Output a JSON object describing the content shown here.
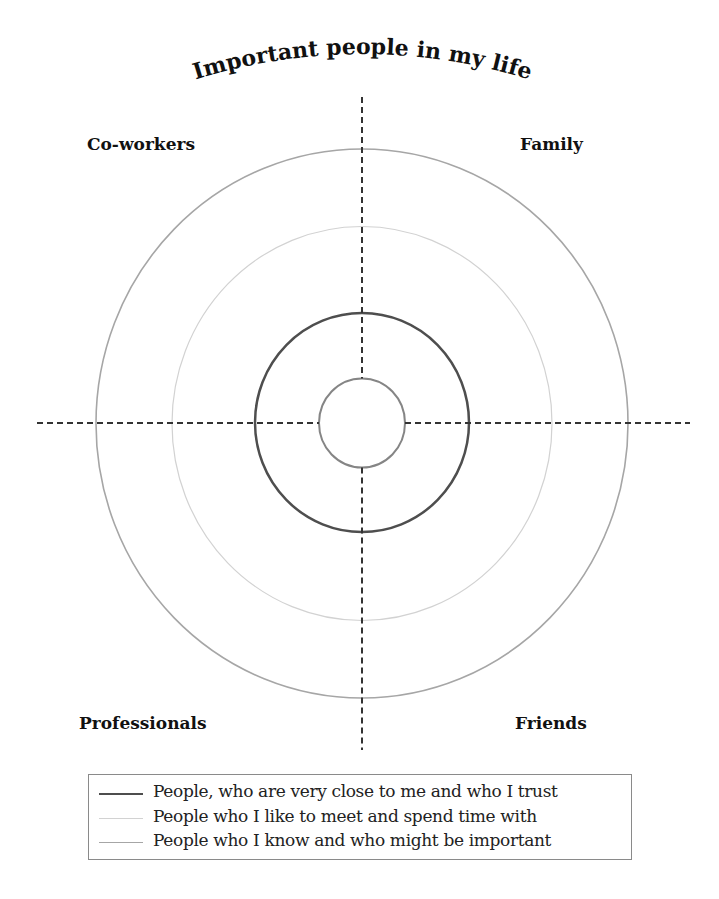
{
  "title": "Important people in my life",
  "quadrants": {
    "top_left": "Co-workers",
    "top_right": "Family",
    "bottom_left": "Professionals",
    "bottom_right": "Friends"
  },
  "circles": [
    {
      "name": "inner",
      "rx": 43,
      "ry": 44.5,
      "stroke": "#858585",
      "width": 2
    },
    {
      "name": "close-trusted",
      "rx": 107,
      "ry": 109.5,
      "stroke": "#4e4e4e",
      "width": 2.5
    },
    {
      "name": "meet-spend-time",
      "rx": 190,
      "ry": 197,
      "stroke": "#d2d2d2",
      "width": 1.2
    },
    {
      "name": "know-might-be-important",
      "rx": 266,
      "ry": 274.5,
      "stroke": "#a6a6a6",
      "width": 1.6
    }
  ],
  "legend": {
    "items": [
      {
        "label": "People, who are very close to me and who I trust",
        "color": "#4e4e4e"
      },
      {
        "label": "People who I like to meet and spend time with",
        "color": "#d2d2d2"
      },
      {
        "label": "People who I know and who might be important",
        "color": "#a6a6a6"
      }
    ]
  },
  "colors": {
    "axis": "#333333",
    "text": "#111111"
  }
}
